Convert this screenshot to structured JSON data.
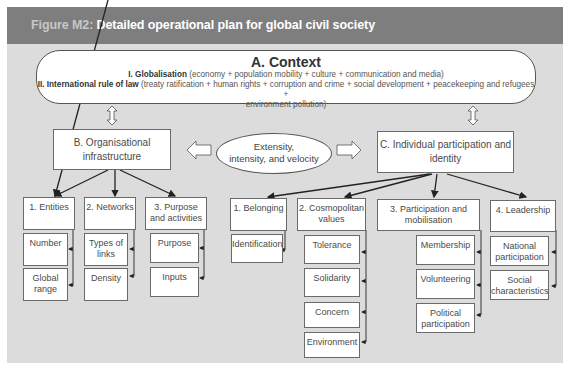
{
  "figure": {
    "label": "Figure M2:",
    "title": "Detailed operational plan for global civil society"
  },
  "context": {
    "title": "A. Context",
    "line1_bold": "I. Globalisation",
    "line1_rest": " (economy + population mobility + culture + communication and media)",
    "line2_bold": "II. International rule of law",
    "line2_rest": " (treaty ratification + human rights + corruption and crime + social development + peacekeeping and refugees +",
    "line3": "environment pollution)"
  },
  "center": {
    "ellipse_line1": "Extensity,",
    "ellipse_line2": "intensity, and  velocity"
  },
  "branch_b": {
    "title_line1": "B. Organisational",
    "title_line2": "infrastructure",
    "children": [
      {
        "label": "1. Entities",
        "items": [
          "Number",
          "Global range"
        ]
      },
      {
        "label": "2. Networks",
        "items": [
          "Types of links",
          "Density"
        ]
      },
      {
        "label": "3. Purpose and activities",
        "items": [
          "Purpose",
          "Inputs"
        ]
      }
    ]
  },
  "branch_c": {
    "title_line1": "C. Individual participation and",
    "title_line2": "identity",
    "children": [
      {
        "label": "1. Belonging",
        "items": [
          "Identification"
        ]
      },
      {
        "label": "2. Cosmopolitan values",
        "items": [
          "Tolerance",
          "Solidarity",
          "Concern",
          "Environment"
        ]
      },
      {
        "label": "3. Participation and mobilisation",
        "items": [
          "Membership",
          "Volunteering",
          "Political participation"
        ]
      },
      {
        "label": "4. Leadership",
        "items": [
          "National participation",
          "Social characteristics"
        ]
      }
    ]
  },
  "colors": {
    "header_bg": "#7e7e7e",
    "panel_bg": "#dcdcdc",
    "box_bg": "#ffffff",
    "stroke": "#222222"
  }
}
